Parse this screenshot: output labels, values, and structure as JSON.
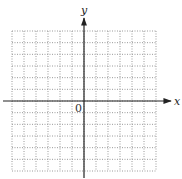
{
  "figure": {
    "type": "coordinate-grid",
    "axes": {
      "x_label": "x",
      "y_label": "y",
      "origin_label": "0"
    },
    "grid": {
      "columns": 12,
      "rows": 12,
      "columns_left_of_y_axis": 6,
      "rows_above_x_axis": 6,
      "line_style": "dotted",
      "line_color": "#9a9a9a"
    },
    "colors": {
      "axis": "#222222",
      "background": "#ffffff"
    }
  }
}
